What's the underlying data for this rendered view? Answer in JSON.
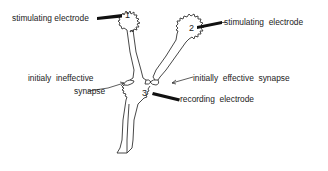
{
  "diagram": {
    "title": "",
    "neurons": [
      {
        "id": "1",
        "role": "presynaptic neuron 1"
      },
      {
        "id": "2",
        "role": "presynaptic neuron 2"
      },
      {
        "id": "3",
        "role": "postsynaptic neuron 3"
      }
    ],
    "labels": {
      "stim_electrode_1": "stimulating electrode",
      "stim_electrode_2": "stimulating  electrode",
      "ineffective_line1": "initialy  ineffective",
      "ineffective_line2": "synapse",
      "effective": "initially  effective  synapse",
      "recording": "recording  electrode"
    },
    "numbers": {
      "n1": "1",
      "n2": "2",
      "n3": "3"
    },
    "colors": {
      "stroke": "#333333",
      "electrode": "#111111",
      "text": "#222222",
      "background": "#ffffff"
    }
  }
}
